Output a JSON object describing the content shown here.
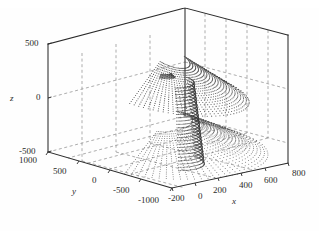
{
  "figure": {
    "kind": "3d-dotted-scatter-plot",
    "background_color": "#fefefe",
    "dot_color": "#3a3a3a",
    "axis_color": "#2a2a2a",
    "grid_color": "#777777",
    "grid_style": "dashed"
  },
  "axes": {
    "z": {
      "label": "z",
      "ticks": [
        "500",
        "0",
        "-500"
      ],
      "values": [
        500,
        0,
        -500
      ],
      "range": [
        -500,
        500
      ]
    },
    "y": {
      "label": "y",
      "ticks": [
        "1000",
        "500",
        "0",
        "-500",
        "-1000"
      ],
      "values": [
        1000,
        500,
        0,
        -500,
        -1000
      ],
      "range": [
        -1000,
        1000
      ]
    },
    "x": {
      "label": "x",
      "ticks": [
        "-200",
        "0",
        "200",
        "400",
        "600",
        "800"
      ],
      "values": [
        -200,
        0,
        200,
        400,
        600,
        800
      ],
      "range": [
        -200,
        800
      ]
    }
  },
  "chart_data": {
    "type": "scatter",
    "title": "",
    "xlabel": "x",
    "ylabel": "y",
    "zlabel": "z",
    "xlim": [
      -200,
      800
    ],
    "ylim": [
      -1000,
      1000
    ],
    "zlim": [
      -500,
      500
    ],
    "grid": true,
    "legend": "none",
    "marker": "dot",
    "series": [
      {
        "name": "surface-dots",
        "arc_families": 3,
        "arcs_per_family": 22,
        "points_per_arc": 46
      }
    ]
  },
  "tick_labels": {
    "z_500": "500",
    "z_0": "0",
    "z_neg500": "-500",
    "y_1000": "1000",
    "y_500": "500",
    "y_0": "0",
    "y_neg500": "-500",
    "y_neg1000": "-1000",
    "x_neg200": "-200",
    "x_0": "0",
    "x_200": "200",
    "x_400": "400",
    "x_600": "600",
    "x_800": "800"
  },
  "axis_titles": {
    "x": "x",
    "y": "y",
    "z": "z"
  }
}
